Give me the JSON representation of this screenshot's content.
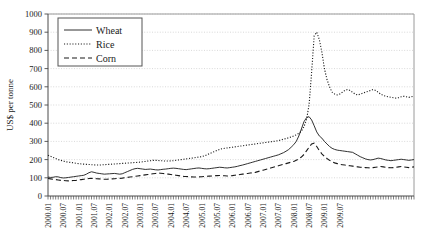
{
  "chart_data": {
    "type": "line",
    "title": "",
    "xlabel": "",
    "ylabel": "US$ per tonne",
    "ylim": [
      0,
      1000
    ],
    "ytick_step": 100,
    "yticks": [
      0,
      100,
      200,
      300,
      400,
      500,
      600,
      700,
      800,
      900,
      1000
    ],
    "grid": true,
    "legend_position": "top-left",
    "x_start": "2000.01",
    "x_end": "2009.12",
    "x_tick_interval_months": 1,
    "x_label_interval_months": 6,
    "xticklabels": [
      "2000.01",
      "2000.07",
      "2001.01",
      "2001.07",
      "2002.01",
      "2002.07",
      "2003.01",
      "2003.07",
      "2004.01",
      "2004.07",
      "2005.01",
      "2005.07",
      "2006.01",
      "2006.07",
      "2007.01",
      "2007.07",
      "2008.01",
      "2008.07",
      "2009.01",
      "2009.07"
    ],
    "series": [
      {
        "name": "Wheat",
        "style": "solid",
        "values": [
          104,
          102,
          103,
          106,
          105,
          101,
          99,
          100,
          102,
          104,
          106,
          108,
          110,
          112,
          114,
          120,
          128,
          133,
          130,
          126,
          124,
          122,
          120,
          121,
          122,
          123,
          124,
          122,
          120,
          122,
          128,
          134,
          140,
          146,
          150,
          152,
          150,
          148,
          146,
          147,
          148,
          146,
          144,
          143,
          145,
          147,
          148,
          150,
          152,
          153,
          152,
          150,
          148,
          146,
          145,
          147,
          149,
          151,
          153,
          154,
          152,
          150,
          149,
          150,
          152,
          154,
          156,
          158,
          157,
          155,
          154,
          156,
          158,
          160,
          163,
          167,
          170,
          174,
          178,
          182,
          186,
          190,
          194,
          198,
          202,
          206,
          210,
          214,
          218,
          222,
          226,
          232,
          238,
          246,
          255,
          268,
          282,
          300,
          330,
          368,
          408,
          430,
          436,
          418,
          386,
          352,
          330,
          318,
          300,
          286,
          272,
          262,
          256,
          252,
          250,
          248,
          246,
          244,
          242,
          240,
          232,
          224,
          216,
          210,
          204,
          200,
          198,
          200,
          204,
          208,
          206,
          202,
          198,
          196,
          194,
          196,
          198,
          200,
          202,
          200,
          198,
          196,
          198,
          200
        ]
      },
      {
        "name": "Rice",
        "style": "dotted",
        "values": [
          224,
          218,
          212,
          206,
          200,
          196,
          192,
          188,
          186,
          184,
          182,
          180,
          178,
          176,
          175,
          174,
          173,
          172,
          171,
          170,
          170,
          171,
          172,
          173,
          174,
          175,
          176,
          177,
          178,
          179,
          180,
          181,
          182,
          183,
          184,
          185,
          186,
          188,
          190,
          192,
          194,
          196,
          196,
          195,
          194,
          193,
          192,
          192,
          193,
          194,
          196,
          198,
          200,
          202,
          204,
          206,
          208,
          210,
          212,
          214,
          216,
          220,
          226,
          232,
          238,
          244,
          250,
          256,
          260,
          262,
          264,
          266,
          268,
          270,
          272,
          274,
          276,
          278,
          280,
          282,
          284,
          286,
          288,
          290,
          292,
          294,
          296,
          298,
          300,
          302,
          304,
          308,
          312,
          316,
          320,
          324,
          330,
          336,
          344,
          356,
          380,
          420,
          500,
          680,
          880,
          900,
          860,
          790,
          700,
          640,
          600,
          570,
          560,
          555,
          560,
          570,
          580,
          585,
          580,
          570,
          560,
          555,
          560,
          565,
          570,
          575,
          580,
          585,
          580,
          570,
          560,
          552,
          548,
          545,
          542,
          540,
          538,
          540,
          545,
          548,
          545,
          542,
          545,
          550
        ]
      },
      {
        "name": "Corn",
        "style": "dashed",
        "values": [
          96,
          94,
          92,
          90,
          88,
          86,
          85,
          84,
          83,
          84,
          85,
          86,
          88,
          90,
          92,
          94,
          96,
          97,
          96,
          95,
          94,
          93,
          92,
          92,
          93,
          94,
          95,
          96,
          97,
          98,
          100,
          102,
          104,
          106,
          108,
          110,
          112,
          114,
          116,
          118,
          120,
          122,
          124,
          126,
          125,
          124,
          122,
          120,
          118,
          116,
          114,
          112,
          110,
          108,
          107,
          106,
          105,
          104,
          104,
          105,
          106,
          107,
          108,
          109,
          110,
          111,
          112,
          113,
          112,
          111,
          110,
          111,
          112,
          114,
          116,
          118,
          120,
          122,
          124,
          126,
          128,
          130,
          134,
          138,
          142,
          146,
          150,
          154,
          158,
          162,
          166,
          170,
          174,
          178,
          182,
          186,
          190,
          196,
          204,
          214,
          228,
          248,
          268,
          286,
          290,
          272,
          250,
          232,
          218,
          206,
          196,
          188,
          182,
          178,
          174,
          172,
          170,
          168,
          166,
          164,
          162,
          160,
          158,
          157,
          156,
          155,
          154,
          156,
          158,
          160,
          162,
          160,
          158,
          156,
          155,
          156,
          158,
          160,
          162,
          160,
          158,
          156,
          158,
          160
        ]
      }
    ],
    "legend": [
      {
        "label": "Wheat",
        "style": "solid"
      },
      {
        "label": "Rice",
        "style": "dotted"
      },
      {
        "label": "Corn",
        "style": "dashed"
      }
    ]
  }
}
